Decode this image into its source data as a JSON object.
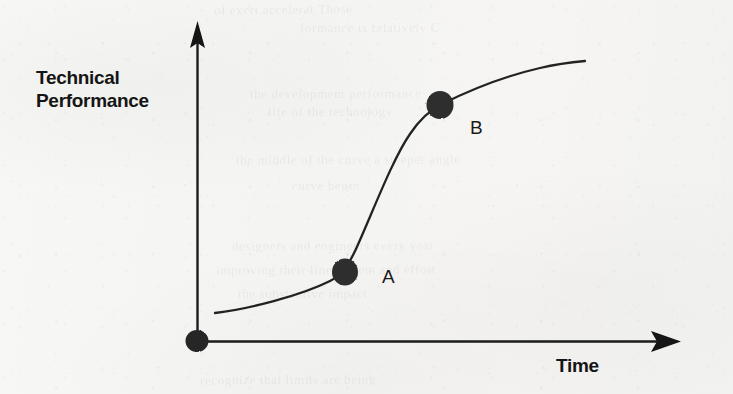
{
  "figure": {
    "type": "s-curve-diagram",
    "background_color": "#f6f6f4",
    "ink_color": "#1b1b1b",
    "marker_color": "#2e2e2e",
    "y_axis": {
      "label_line1": "Technical",
      "label_line2": "Performance",
      "arrow": "up-arrow-icon"
    },
    "x_axis": {
      "label": "Time",
      "arrow": "right-arrow-icon"
    },
    "markers": [
      {
        "name": "origin",
        "label": "",
        "x": 197,
        "y": 341,
        "size": 22
      },
      {
        "name": "point-a",
        "label": "A",
        "x": 345,
        "y": 272,
        "size": 26
      },
      {
        "name": "point-b",
        "label": "B",
        "x": 440,
        "y": 105,
        "size": 27
      }
    ]
  },
  "chart_data": {
    "type": "line",
    "title": "",
    "xlabel": "Time",
    "ylabel": "Technical Performance",
    "grid": false,
    "legend": null,
    "axis_ticks": {
      "x": [],
      "y": []
    },
    "series": [
      {
        "name": "Technology S-curve",
        "x": [
          0.04,
          0.12,
          0.22,
          0.3,
          0.36,
          0.42,
          0.48,
          0.55,
          0.62,
          0.7,
          0.78,
          0.86,
          0.94,
          1.0
        ],
        "y": [
          0.09,
          0.12,
          0.16,
          0.21,
          0.25,
          0.34,
          0.5,
          0.68,
          0.8,
          0.86,
          0.9,
          0.93,
          0.95,
          0.96
        ]
      }
    ],
    "annotations": [
      {
        "label": "A",
        "x": 0.305,
        "y": 0.218,
        "description": "inflection onset on the S-curve"
      },
      {
        "label": "B",
        "x": 0.503,
        "y": 0.745,
        "description": "onset of the plateau on the S-curve"
      },
      {
        "label": "",
        "x": 0.0,
        "y": 0.0,
        "description": "origin marker at the axis intersection"
      }
    ],
    "xlim": [
      0,
      1
    ],
    "ylim": [
      0,
      1
    ]
  },
  "ghosts": [
    {
      "text": "of exert accelerat Those",
      "x": 214,
      "y": 2,
      "size": 13,
      "rot": -0.5
    },
    {
      "text": "formance is relatively C",
      "x": 300,
      "y": 20,
      "size": 13,
      "rot": -0.4
    },
    {
      "text": "the development  performance",
      "x": 250,
      "y": 86,
      "size": 13,
      "rot": -0.3
    },
    {
      "text": "life of the technology",
      "x": 268,
      "y": 104,
      "size": 13,
      "rot": -0.3
    },
    {
      "text": "the middle of the curve a steeper angle",
      "x": 236,
      "y": 152,
      "size": 13,
      "rot": -0.3
    },
    {
      "text": "curve begin",
      "x": 292,
      "y": 178,
      "size": 13,
      "rot": -0.3
    },
    {
      "text": "designers and engineers every year",
      "x": 232,
      "y": 238,
      "size": 13,
      "rot": -0.3
    },
    {
      "text": "improving their line system and effort",
      "x": 216,
      "y": 262,
      "size": 13,
      "rot": -0.3
    },
    {
      "text": "the substantive impact",
      "x": 238,
      "y": 286,
      "size": 13,
      "rot": -0.3
    },
    {
      "text": "recognize that limits  are being",
      "x": 200,
      "y": 372,
      "size": 13,
      "rot": -0.3
    }
  ]
}
